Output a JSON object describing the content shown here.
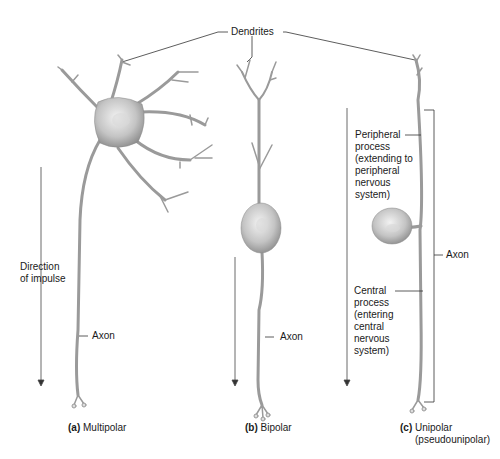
{
  "labels": {
    "dendrites": "Dendrites",
    "direction_line1": "Direction",
    "direction_line2": "of impulse",
    "axon_a": "Axon",
    "axon_b": "Axon",
    "axon_c": "Axon",
    "peripheral": [
      "Peripheral",
      "process",
      "(extending to",
      "peripheral",
      "nervous",
      "system)"
    ],
    "central": [
      "Central",
      "process",
      "(entering",
      "central",
      "nervous",
      "system)"
    ]
  },
  "captions": {
    "a": {
      "letter": "(a)",
      "text": "Multipolar"
    },
    "b": {
      "letter": "(b)",
      "text": "Bipolar"
    },
    "c": {
      "letter": "(c)",
      "text": "Unipolar",
      "sub": "(pseudounipolar)"
    }
  },
  "colors": {
    "neuron_fill": "#c8c8c8",
    "neuron_dark": "#8a8a8a",
    "line": "#333333",
    "text": "#1a1a1a"
  }
}
